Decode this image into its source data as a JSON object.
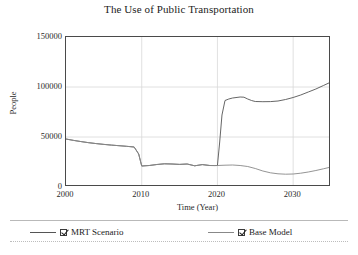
{
  "chart_data": {
    "type": "line",
    "title": "The Use of Public Transportation",
    "xlabel": "Time (Year)",
    "ylabel": "People",
    "xlim": [
      2000,
      2035
    ],
    "ylim": [
      0,
      150000
    ],
    "xticks": [
      2000,
      2010,
      2020,
      2030
    ],
    "yticks": [
      0,
      50000,
      100000,
      150000
    ],
    "xtick_labels": [
      "2000",
      "2010",
      "2020",
      "2030"
    ],
    "ytick_labels": [
      "0",
      "50000",
      "100000",
      "150000"
    ],
    "grid": true,
    "grid_color": "#d8d8d8",
    "legend_position": "bottom",
    "line_color": "#555555",
    "series": [
      {
        "name": "MRT Scenario",
        "checked": true,
        "color": "#555555",
        "x": [
          2000,
          2001,
          2002,
          2003,
          2004,
          2005,
          2006,
          2007,
          2008,
          2009,
          2009.6,
          2010,
          2011,
          2012,
          2013,
          2014,
          2015,
          2016,
          2017,
          2018,
          2019,
          2019.6,
          2020,
          2020.3,
          2020.6,
          2021,
          2021.5,
          2022,
          2023,
          2023.5,
          2024,
          2024.5,
          2025,
          2026,
          2027,
          2028,
          2029,
          2030,
          2031,
          2032,
          2033,
          2034,
          2035
        ],
        "y": [
          48000,
          46600,
          45400,
          44300,
          43400,
          42600,
          41900,
          41300,
          40700,
          40000,
          33000,
          21000,
          21500,
          22500,
          23200,
          23000,
          22600,
          23000,
          21200,
          22400,
          21500,
          21400,
          21500,
          45000,
          72000,
          86500,
          88000,
          89000,
          90000,
          89800,
          88000,
          86500,
          85500,
          85300,
          85400,
          86000,
          87500,
          89500,
          92000,
          95000,
          98000,
          101500,
          105000
        ]
      },
      {
        "name": "Base Model",
        "checked": true,
        "color": "#888888",
        "x": [
          2000,
          2001,
          2002,
          2003,
          2004,
          2005,
          2006,
          2007,
          2008,
          2009,
          2009.6,
          2010,
          2011,
          2012,
          2013,
          2014,
          2015,
          2016,
          2017,
          2018,
          2019,
          2020,
          2021,
          2022,
          2023,
          2024,
          2025,
          2026,
          2027,
          2028,
          2029,
          2030,
          2031,
          2032,
          2033,
          2034,
          2035
        ],
        "y": [
          48000,
          46600,
          45400,
          44300,
          43400,
          42600,
          41900,
          41300,
          40700,
          40000,
          33000,
          21000,
          21500,
          22500,
          23200,
          23000,
          22600,
          23000,
          21200,
          22400,
          21500,
          21500,
          21800,
          22000,
          21500,
          20500,
          18500,
          16000,
          14200,
          13200,
          12800,
          13000,
          13800,
          15000,
          16500,
          18200,
          20000
        ]
      }
    ]
  },
  "legend": {
    "entries": [
      {
        "label": "MRT Scenario"
      },
      {
        "label": "Base Model"
      }
    ]
  }
}
